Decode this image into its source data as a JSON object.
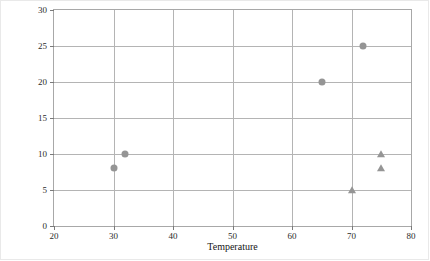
{
  "chart_data": {
    "type": "scatter",
    "title": "",
    "xlabel": "Temperature",
    "ylabel": "Wind",
    "xlim": [
      20,
      80
    ],
    "ylim": [
      0,
      30
    ],
    "xticks": [
      20,
      30,
      40,
      50,
      60,
      70,
      80
    ],
    "yticks": [
      0,
      5,
      10,
      15,
      20,
      25,
      30
    ],
    "grid": true,
    "legend": "none",
    "marker_color": "#959595",
    "series": [
      {
        "name": "circles",
        "marker": "circle",
        "points": [
          {
            "x": 30,
            "y": 8
          },
          {
            "x": 32,
            "y": 10
          },
          {
            "x": 65,
            "y": 20
          },
          {
            "x": 72,
            "y": 25
          }
        ]
      },
      {
        "name": "triangles",
        "marker": "triangle",
        "points": [
          {
            "x": 70,
            "y": 5
          },
          {
            "x": 75,
            "y": 8
          },
          {
            "x": 75,
            "y": 10
          }
        ]
      }
    ]
  }
}
